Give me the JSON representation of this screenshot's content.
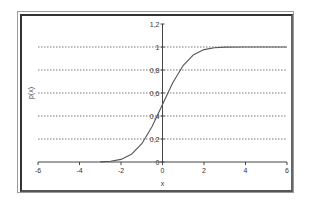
{
  "chart_data": {
    "type": "line",
    "title": "",
    "xlabel": "x",
    "ylabel": "p(x)",
    "xlim": [
      -6,
      6
    ],
    "ylim": [
      0,
      1.2
    ],
    "x_ticks": [
      "-6",
      "-4",
      "-2",
      "0",
      "2",
      "4",
      "6"
    ],
    "y_ticks": [
      "0",
      "0.2",
      "0.4",
      "0.6",
      "0.8",
      "1",
      "1.2"
    ],
    "grid": "horizontal dotted at 0.2 intervals (0.2–1.0)",
    "legend": "none",
    "series": [
      {
        "name": "p(x)",
        "color": "#555555",
        "x": [
          -3,
          -2.5,
          -2,
          -1.5,
          -1,
          -0.5,
          0,
          0.5,
          1,
          1.5,
          2,
          2.5,
          3,
          4,
          5,
          6
        ],
        "values": [
          0.001,
          0.006,
          0.023,
          0.067,
          0.159,
          0.309,
          0.5,
          0.691,
          0.841,
          0.933,
          0.977,
          0.994,
          0.999,
          1.0,
          1.0,
          1.0
        ]
      }
    ]
  },
  "axes": {
    "x_label": "x",
    "y_label": "p(x)"
  }
}
